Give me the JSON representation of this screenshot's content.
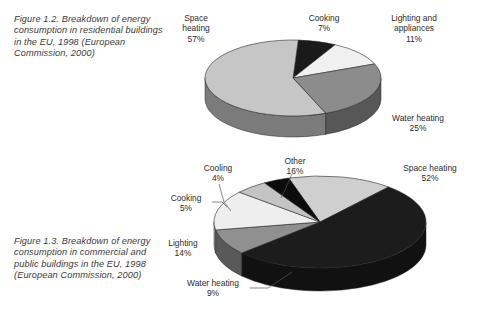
{
  "figures": [
    {
      "id": "figure-1-2",
      "caption": "Figure 1.2. Breakdown of energy consumption in residential buildings in the EU, 1998 (European Commission, 2000)",
      "chart_data": {
        "type": "pie",
        "title": "Breakdown of energy consumption in residential buildings in the EU, 1998",
        "three_d": true,
        "legend": "none",
        "labels_position": "outside",
        "categories": [
          "Space heating",
          "Water heating",
          "Lighting and appliances",
          "Cooking"
        ],
        "values": [
          57,
          25,
          11,
          7
        ],
        "unit": "%",
        "colors": [
          "#c9c9c9",
          "#0a0a0a",
          "#efefef",
          "#7c7c7c"
        ],
        "slices": [
          {
            "label": "Space heating",
            "value": 57,
            "display": "57%",
            "color": "#c9c9c9"
          },
          {
            "label": "Water heating",
            "value": 25,
            "display": "25%",
            "color": "#0a0a0a"
          },
          {
            "label": "Lighting and appliances",
            "value": 11,
            "display": "11%",
            "color": "#efefef"
          },
          {
            "label": "Cooking",
            "value": 7,
            "display": "7%",
            "color": "#7c7c7c"
          }
        ]
      },
      "labels": {
        "space_heating": {
          "name": "Space",
          "name2": "heating",
          "pct": "57%"
        },
        "cooking": {
          "name": "Cooking",
          "pct": "7%"
        },
        "lighting": {
          "name": "Lighting and",
          "name2": "appliances",
          "pct": "11%"
        },
        "water_heating": {
          "name": "Water heating",
          "pct": "25%"
        }
      }
    },
    {
      "id": "figure-1-3",
      "caption": "Figure 1.3. Breakdown of energy consumption in commercial and public buildings in the EU, 1998 (European Commission, 2000)",
      "chart_data": {
        "type": "pie",
        "title": "Breakdown of energy consumption in commercial and public buildings in the EU, 1998",
        "three_d": true,
        "legend": "none",
        "labels_position": "outside",
        "categories": [
          "Space heating",
          "Other",
          "Lighting",
          "Water heating",
          "Cooking",
          "Cooling"
        ],
        "values": [
          52,
          16,
          14,
          9,
          5,
          4
        ],
        "unit": "%",
        "colors": [
          "#141414",
          "#c9c9c9",
          "#bdbdbd",
          "#8a8a8a",
          "#0a0a0a",
          "#6e6e6e"
        ],
        "slices": [
          {
            "label": "Space heating",
            "value": 52,
            "display": "52%",
            "color": "#141414"
          },
          {
            "label": "Other",
            "value": 16,
            "display": "16%",
            "color": "#c9c9c9"
          },
          {
            "label": "Cooling",
            "value": 4,
            "display": "4%",
            "color": "#6e6e6e"
          },
          {
            "label": "Cooking",
            "value": 5,
            "display": "5%",
            "color": "#0a0a0a"
          },
          {
            "label": "Lighting",
            "value": 14,
            "display": "14%",
            "color": "#ededed"
          },
          {
            "label": "Water heating",
            "value": 9,
            "display": "9%",
            "color": "#8a8a8a"
          }
        ]
      },
      "labels": {
        "cooling": {
          "name": "Cooling",
          "pct": "4%"
        },
        "other": {
          "name": "Other",
          "pct": "16%"
        },
        "cooking": {
          "name": "Cooking",
          "pct": "5%"
        },
        "space_heating": {
          "name": "Space heating",
          "pct": "52%"
        },
        "lighting": {
          "name": "Lighting",
          "pct": "14%"
        },
        "water_heating": {
          "name": "Water heating",
          "pct": "9%"
        }
      }
    }
  ]
}
